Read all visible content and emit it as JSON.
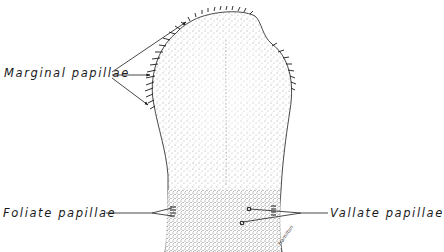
{
  "figure": {
    "style": "stippled pen illustration",
    "colors": {
      "background": "#ffffff",
      "ink": "#1a1a1a"
    }
  },
  "labels": {
    "marginal": "Marginal papillae",
    "foliate": "Foliate papillae",
    "vallate": "Vallate papillae"
  },
  "signature": "Hamilton"
}
